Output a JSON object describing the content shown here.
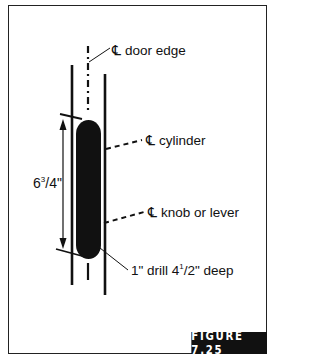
{
  "figure": {
    "label": "FIGURE 7.25"
  },
  "labels": {
    "centerline_symbol": "℄",
    "door_edge": "door edge",
    "cylinder": "cylinder",
    "knob_or_lever": "knob or lever",
    "dimension_whole": "6",
    "dimension_num": "3",
    "dimension_den": "/4\"",
    "drill_prefix": "1\" drill 4",
    "drill_num": "1",
    "drill_den": "/2\"",
    "drill_suffix": " deep"
  },
  "colors": {
    "ink": "#111111",
    "background": "#ffffff"
  }
}
